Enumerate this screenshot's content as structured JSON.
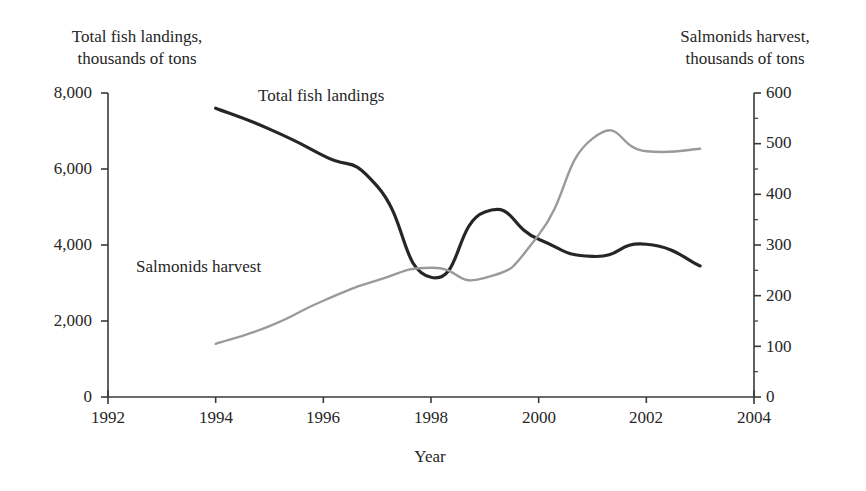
{
  "chart_data": {
    "type": "line",
    "title": "",
    "xlabel": "Year",
    "ylabel": "Total fish landings,\nthousands of tons",
    "y2label": "Salmonids harvest,\nthousands of tons",
    "xlim": [
      1992,
      2004
    ],
    "ylim": [
      0,
      8000
    ],
    "y2lim": [
      0,
      600
    ],
    "grid": false,
    "legend": "inline-annotations",
    "xticks": [
      "1992",
      "1994",
      "1996",
      "1998",
      "2000",
      "2002",
      "2004"
    ],
    "xtick_values": [
      1992,
      1994,
      1996,
      1998,
      2000,
      2002,
      2004
    ],
    "yticks": [
      "0",
      "2,000",
      "4,000",
      "6,000",
      "8,000"
    ],
    "ytick_values": [
      0,
      2000,
      4000,
      6000,
      8000
    ],
    "y2ticks": [
      "0",
      "100",
      "200",
      "300",
      "400",
      "500",
      "600"
    ],
    "y2tick_values": [
      0,
      100,
      200,
      300,
      400,
      500,
      600
    ],
    "y2_minor_ticks": [
      50,
      150,
      250,
      350,
      450,
      550
    ],
    "series": [
      {
        "name": "Total fish landings",
        "axis": "left",
        "color": "#262626",
        "width": 3.2,
        "x": [
          1994,
          1995,
          1996,
          1997,
          1998,
          1999,
          2000,
          2001,
          2002,
          2003
        ],
        "values": [
          7600,
          7050,
          6350,
          5550,
          3150,
          4870,
          4150,
          3700,
          4020,
          3450
        ]
      },
      {
        "name": "Salmonids harvest",
        "axis": "right",
        "color": "#9a9a9a",
        "width": 2.4,
        "x": [
          1994,
          1995,
          1996,
          1997,
          1998,
          1999,
          2000,
          2001,
          2002,
          2003
        ],
        "values": [
          105,
          140,
          190,
          230,
          255,
          235,
          320,
          510,
          485,
          490
        ]
      }
    ],
    "annotations": [
      {
        "text": "Total fish landings",
        "series": "Total fish landings"
      },
      {
        "text": "Salmonids harvest",
        "series": "Salmonids harvest"
      }
    ]
  },
  "axes": {
    "left_title": "Total fish landings,\nthousands of tons",
    "right_title": "Salmonids harvest,\nthousands of tons",
    "x_title": "Year"
  },
  "annotations": {
    "total_fish_landings": "Total fish landings",
    "salmonids_harvest": "Salmonids harvest"
  },
  "ticks": {
    "y_left": [
      "8,000",
      "6,000",
      "4,000",
      "2,000",
      "0"
    ],
    "y_right": [
      "600",
      "500",
      "400",
      "300",
      "200",
      "100",
      "0"
    ],
    "x": [
      "1992",
      "1994",
      "1996",
      "1998",
      "2000",
      "2002",
      "2004"
    ]
  }
}
